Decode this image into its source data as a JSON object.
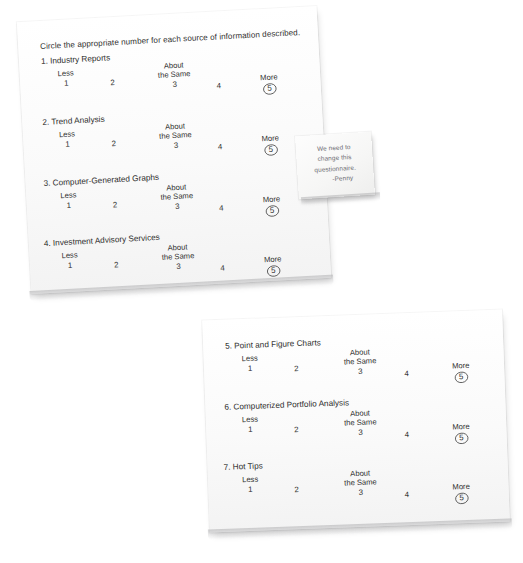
{
  "scene": {
    "background_color": "#ffffff",
    "paper_color": "#fbfbfb",
    "ink_color": "#2e2e2d",
    "note_ink_color": "#6e6e74"
  },
  "sheet_top": {
    "instruction": "Circle the appropriate number for each source of information described.",
    "questions": [
      {
        "title": "1. Industry Reports",
        "scale": {
          "less_label": "Less",
          "less_value": "1",
          "mid_value": "2",
          "same_label_line1": "About",
          "same_label_line2": "the Same",
          "same_value": "3",
          "high_value": "4",
          "more_label": "More",
          "more_value": "5",
          "circled_value": "5"
        }
      },
      {
        "title": "2. Trend Analysis",
        "scale": {
          "less_label": "Less",
          "less_value": "1",
          "mid_value": "2",
          "same_label_line1": "About",
          "same_label_line2": "the Same",
          "same_value": "3",
          "high_value": "4",
          "more_label": "More",
          "more_value": "5",
          "circled_value": "5"
        }
      },
      {
        "title": "3. Computer-Generated Graphs",
        "scale": {
          "less_label": "Less",
          "less_value": "1",
          "mid_value": "2",
          "same_label_line1": "About",
          "same_label_line2": "the Same",
          "same_value": "3",
          "high_value": "4",
          "more_label": "More",
          "more_value": "5",
          "circled_value": "5"
        }
      },
      {
        "title": "4. Investment Advisory Services",
        "scale": {
          "less_label": "Less",
          "less_value": "1",
          "mid_value": "2",
          "same_label_line1": "About",
          "same_label_line2": "the Same",
          "same_value": "3",
          "high_value": "4",
          "more_label": "More",
          "more_value": "5",
          "circled_value": "5"
        }
      }
    ]
  },
  "sheet_bottom": {
    "questions": [
      {
        "title": "5. Point and Figure Charts",
        "scale": {
          "less_label": "Less",
          "less_value": "1",
          "mid_value": "2",
          "same_label_line1": "About",
          "same_label_line2": "the Same",
          "same_value": "3",
          "high_value": "4",
          "more_label": "More",
          "more_value": "5",
          "circled_value": "5"
        }
      },
      {
        "title": "6. Computerized Portfolio Analysis",
        "scale": {
          "less_label": "Less",
          "less_value": "1",
          "mid_value": "2",
          "same_label_line1": "About",
          "same_label_line2": "the Same",
          "same_value": "3",
          "high_value": "4",
          "more_label": "More",
          "more_value": "5",
          "circled_value": "5"
        }
      },
      {
        "title": "7. Hot Tips",
        "scale": {
          "less_label": "Less",
          "less_value": "1",
          "mid_value": "2",
          "same_label_line1": "About",
          "same_label_line2": "the Same",
          "same_value": "3",
          "high_value": "4",
          "more_label": "More",
          "more_value": "5",
          "circled_value": "5"
        }
      }
    ]
  },
  "sticky_note": {
    "line1": "We need to",
    "line2": "change this",
    "line3": "questionnaire.",
    "signature": "-Penny"
  }
}
